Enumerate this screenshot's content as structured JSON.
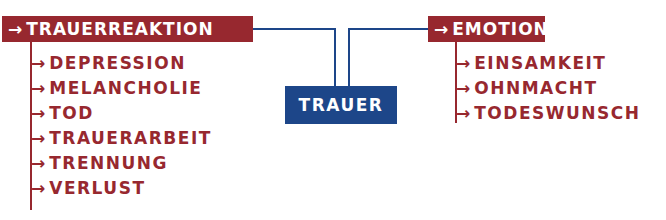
{
  "arrow_glyph": "→",
  "center": {
    "label": "TRAUER",
    "color": "#1d4689"
  },
  "left": {
    "header": "TRAUERREAKTION",
    "items": [
      "DEPRESSION",
      "MELANCHOLIE",
      "TOD",
      "TRAUERARBEIT",
      "TRENNUNG",
      "VERLUST"
    ]
  },
  "right": {
    "header": "EMOTIONEN",
    "items": [
      "EINSAMKEIT",
      "OHNMACHT",
      "TODESWUNSCH"
    ]
  },
  "colors": {
    "category": "#97282f",
    "center": "#1d4689"
  }
}
